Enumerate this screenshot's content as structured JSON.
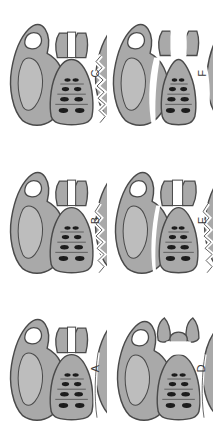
{
  "figure": {
    "orientation": "rotated-90-ccw",
    "background_color": "#ffffff",
    "bone_fill_color": "#a9a9a9",
    "bone_fill_color_light": "#bdbdbd",
    "bone_outline_color": "#4a4a4a",
    "foramen_color": "#1c1c1c",
    "gap_color": "#ffffff",
    "label_color": "#3a3a3a",
    "panel_count": 6
  },
  "panels": [
    {
      "id": "panel-c",
      "label": "C",
      "position": "top-left",
      "description": "Anteroposterior pelvis with serrated iliac wing fracture and symphyseal diastasis",
      "features": {
        "symphysis_gap": true,
        "left_sacroiliac_disruption": false,
        "right_sacroiliac_disruption": false,
        "serrated_fracture_line": true,
        "sacral_foramina": 4,
        "vertical_displacement": false
      }
    },
    {
      "id": "panel-f",
      "label": "F",
      "position": "top-right",
      "description": "Complete bilateral separation of sacrum from both innominate bones with wide gaps",
      "features": {
        "symphysis_gap": true,
        "left_sacroiliac_disruption": true,
        "right_sacroiliac_disruption": true,
        "serrated_fracture_line": false,
        "sacral_foramina": 4,
        "vertical_displacement": true
      }
    },
    {
      "id": "panel-b",
      "label": "B",
      "position": "middle-left",
      "description": "Symphyseal widening with unilateral serrated ramus fracture line",
      "features": {
        "symphysis_gap": true,
        "left_sacroiliac_disruption": false,
        "right_sacroiliac_disruption": false,
        "serrated_fracture_line": true,
        "sacral_foramina": 4,
        "vertical_displacement": false
      }
    },
    {
      "id": "panel-e",
      "label": "E",
      "position": "middle-right",
      "description": "Symphyseal disruption with serrated fracture and unilateral sacroiliac widening",
      "features": {
        "symphysis_gap": true,
        "left_sacroiliac_disruption": true,
        "right_sacroiliac_disruption": false,
        "serrated_fracture_line": true,
        "sacral_foramina": 4,
        "vertical_displacement": false
      }
    },
    {
      "id": "panel-a",
      "label": "A",
      "position": "bottom-left",
      "description": "Intact pelvic ring with narrow symphyseal line, reference configuration",
      "features": {
        "symphysis_gap": true,
        "left_sacroiliac_disruption": false,
        "right_sacroiliac_disruption": false,
        "serrated_fracture_line": false,
        "sacral_foramina": 4,
        "vertical_displacement": false
      }
    },
    {
      "id": "panel-d",
      "label": "D",
      "position": "bottom-right",
      "description": "Open-book injury with wide anterior symphyseal separation of pubic bones",
      "features": {
        "symphysis_gap": true,
        "left_sacroiliac_disruption": false,
        "right_sacroiliac_disruption": false,
        "serrated_fracture_line": false,
        "sacral_foramina": 4,
        "vertical_displacement": false
      }
    }
  ]
}
